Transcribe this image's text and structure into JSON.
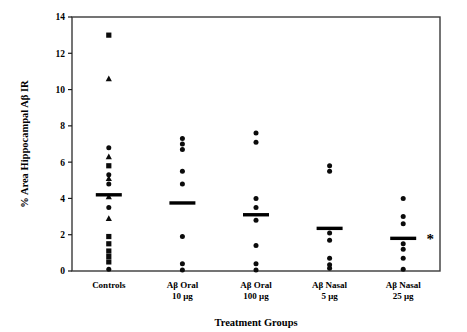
{
  "chart_data": {
    "type": "scatter",
    "title": "",
    "xlabel": "Treatment Groups",
    "ylabel": "% Area Hippocampal Aβ IR",
    "ylim": [
      0,
      14
    ],
    "yticks": [
      0,
      2,
      4,
      6,
      8,
      10,
      12,
      14
    ],
    "ytick_labels": [
      "0",
      "2",
      "4",
      "6",
      "8",
      "10",
      "12",
      "14"
    ],
    "grid": false,
    "legend": "none",
    "categories": [
      "Controls",
      "Aβ Oral\n10 μg",
      "Aβ Oral\n100 μg",
      "Aβ Nasal\n5 μg",
      "Aβ Nasal\n25 μg"
    ],
    "category_labels": [
      {
        "line1": "Controls",
        "line2": ""
      },
      {
        "line1": "Aβ Oral",
        "line2": "10 μg"
      },
      {
        "line1": "Aβ Oral",
        "line2": "100 μg"
      },
      {
        "line1": "Aβ Nasal",
        "line2": "5 μg"
      },
      {
        "line1": "Aβ Nasal",
        "line2": "25 μg"
      }
    ],
    "groups": [
      {
        "name": "Controls",
        "mean": 4.2,
        "significant": false,
        "points": [
          {
            "value": 13.0,
            "marker": "square"
          },
          {
            "value": 10.6,
            "marker": "triangle"
          },
          {
            "value": 6.8,
            "marker": "circle"
          },
          {
            "value": 6.3,
            "marker": "triangle"
          },
          {
            "value": 5.8,
            "marker": "square"
          },
          {
            "value": 5.3,
            "marker": "circle"
          },
          {
            "value": 5.1,
            "marker": "triangle"
          },
          {
            "value": 4.8,
            "marker": "circle"
          },
          {
            "value": 4.1,
            "marker": "triangle"
          },
          {
            "value": 3.5,
            "marker": "circle"
          },
          {
            "value": 2.9,
            "marker": "triangle"
          },
          {
            "value": 1.9,
            "marker": "square"
          },
          {
            "value": 1.5,
            "marker": "square"
          },
          {
            "value": 1.1,
            "marker": "square"
          },
          {
            "value": 0.8,
            "marker": "square"
          },
          {
            "value": 0.5,
            "marker": "square"
          },
          {
            "value": 0.1,
            "marker": "circle"
          }
        ]
      },
      {
        "name": "Aβ Oral 10 μg",
        "mean": 3.75,
        "significant": false,
        "points": [
          {
            "value": 7.3,
            "marker": "circle"
          },
          {
            "value": 7.0,
            "marker": "circle"
          },
          {
            "value": 6.7,
            "marker": "circle"
          },
          {
            "value": 5.5,
            "marker": "circle"
          },
          {
            "value": 4.8,
            "marker": "circle"
          },
          {
            "value": 1.9,
            "marker": "circle"
          },
          {
            "value": 0.4,
            "marker": "circle"
          },
          {
            "value": 0.05,
            "marker": "circle"
          }
        ]
      },
      {
        "name": "Aβ Oral 100 μg",
        "mean": 3.1,
        "significant": false,
        "points": [
          {
            "value": 7.6,
            "marker": "circle"
          },
          {
            "value": 7.1,
            "marker": "circle"
          },
          {
            "value": 4.0,
            "marker": "circle"
          },
          {
            "value": 3.5,
            "marker": "circle"
          },
          {
            "value": 2.8,
            "marker": "circle"
          },
          {
            "value": 1.4,
            "marker": "circle"
          },
          {
            "value": 0.4,
            "marker": "circle"
          },
          {
            "value": 0.05,
            "marker": "circle"
          }
        ]
      },
      {
        "name": "Aβ Nasal 5 μg",
        "mean": 2.35,
        "significant": false,
        "points": [
          {
            "value": 5.8,
            "marker": "circle"
          },
          {
            "value": 5.5,
            "marker": "circle"
          },
          {
            "value": 2.1,
            "marker": "circle"
          },
          {
            "value": 1.7,
            "marker": "circle"
          },
          {
            "value": 0.7,
            "marker": "circle"
          },
          {
            "value": 0.35,
            "marker": "circle"
          },
          {
            "value": 0.15,
            "marker": "circle"
          }
        ]
      },
      {
        "name": "Aβ Nasal 25 μg",
        "mean": 1.8,
        "significant": true,
        "significance_marker": "*",
        "points": [
          {
            "value": 4.0,
            "marker": "circle"
          },
          {
            "value": 3.0,
            "marker": "circle"
          },
          {
            "value": 2.6,
            "marker": "circle"
          },
          {
            "value": 1.5,
            "marker": "circle"
          },
          {
            "value": 1.2,
            "marker": "circle"
          },
          {
            "value": 0.7,
            "marker": "circle"
          },
          {
            "value": 0.1,
            "marker": "circle"
          }
        ]
      }
    ]
  }
}
